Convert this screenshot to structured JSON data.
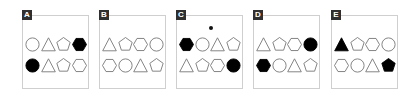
{
  "colors": {
    "stroke": "#777777",
    "fill_dark": "#000000",
    "label_bg": "#2f2f2f",
    "label_fg": "#ffffff",
    "border": "#cfcfcf"
  },
  "panels": [
    {
      "label": "A",
      "x": 22,
      "dot": false,
      "rows": [
        [
          {
            "shape": "circle",
            "filled": false
          },
          {
            "shape": "triangle",
            "filled": false
          },
          {
            "shape": "pentagon",
            "filled": false
          },
          {
            "shape": "hexagon",
            "filled": true
          }
        ],
        [
          {
            "shape": "circle",
            "filled": true
          },
          {
            "shape": "triangle",
            "filled": false
          },
          {
            "shape": "pentagon",
            "filled": false
          },
          {
            "shape": "hexagon",
            "filled": false
          }
        ]
      ]
    },
    {
      "label": "B",
      "x": 99,
      "dot": false,
      "rows": [
        [
          {
            "shape": "triangle",
            "filled": false
          },
          {
            "shape": "pentagon",
            "filled": false
          },
          {
            "shape": "hexagon",
            "filled": false
          },
          {
            "shape": "circle",
            "filled": false
          }
        ],
        [
          {
            "shape": "hexagon",
            "filled": false
          },
          {
            "shape": "circle",
            "filled": false
          },
          {
            "shape": "triangle",
            "filled": false
          },
          {
            "shape": "pentagon",
            "filled": false
          }
        ]
      ]
    },
    {
      "label": "C",
      "x": 176,
      "dot": true,
      "rows": [
        [
          {
            "shape": "hexagon",
            "filled": true
          },
          {
            "shape": "circle",
            "filled": false
          },
          {
            "shape": "triangle",
            "filled": false
          },
          {
            "shape": "pentagon",
            "filled": false
          }
        ],
        [
          {
            "shape": "triangle",
            "filled": false
          },
          {
            "shape": "pentagon",
            "filled": false
          },
          {
            "shape": "hexagon",
            "filled": false
          },
          {
            "shape": "circle",
            "filled": true
          }
        ]
      ]
    },
    {
      "label": "D",
      "x": 253,
      "dot": false,
      "rows": [
        [
          {
            "shape": "triangle",
            "filled": false
          },
          {
            "shape": "pentagon",
            "filled": false
          },
          {
            "shape": "hexagon",
            "filled": false
          },
          {
            "shape": "circle",
            "filled": true
          }
        ],
        [
          {
            "shape": "hexagon",
            "filled": true
          },
          {
            "shape": "circle",
            "filled": false
          },
          {
            "shape": "triangle",
            "filled": false
          },
          {
            "shape": "pentagon",
            "filled": false
          }
        ]
      ]
    },
    {
      "label": "E",
      "x": 331,
      "dot": false,
      "rows": [
        [
          {
            "shape": "triangle",
            "filled": true
          },
          {
            "shape": "pentagon",
            "filled": false
          },
          {
            "shape": "hexagon",
            "filled": false
          },
          {
            "shape": "circle",
            "filled": false
          }
        ],
        [
          {
            "shape": "hexagon",
            "filled": false
          },
          {
            "shape": "circle",
            "filled": false
          },
          {
            "shape": "triangle",
            "filled": false
          },
          {
            "shape": "pentagon",
            "filled": true
          }
        ]
      ]
    }
  ]
}
